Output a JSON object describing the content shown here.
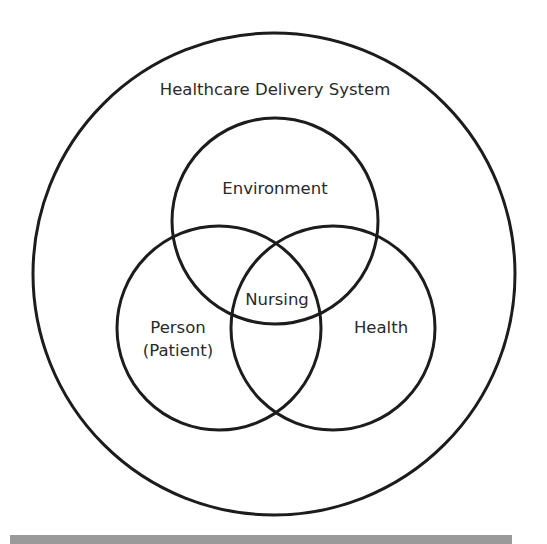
{
  "diagram": {
    "title": "Healthcare Delivery System",
    "circles": [
      {
        "id": "outer",
        "label": "Healthcare Delivery System",
        "cx": 274,
        "cy": 274,
        "r": 241
      },
      {
        "id": "environment",
        "label": "Environment",
        "cx": 275,
        "cy": 221,
        "r": 103
      },
      {
        "id": "person",
        "label_line1": "Person",
        "label_line2": "(Patient)",
        "cx": 219,
        "cy": 328,
        "r": 102
      },
      {
        "id": "health",
        "label": "Health",
        "cx": 333,
        "cy": 328,
        "r": 102
      }
    ],
    "center_label": "Nursing",
    "labels": {
      "system": "Healthcare Delivery System",
      "environment": "Environment",
      "nursing": "Nursing",
      "person_line1": "Person",
      "person_line2": "(Patient)",
      "health": "Health"
    },
    "colors": {
      "stroke": "#1c1c1c",
      "text": "#2a2a2a",
      "background": "#ffffff",
      "bottom_bar": "#9a9a9a"
    }
  }
}
